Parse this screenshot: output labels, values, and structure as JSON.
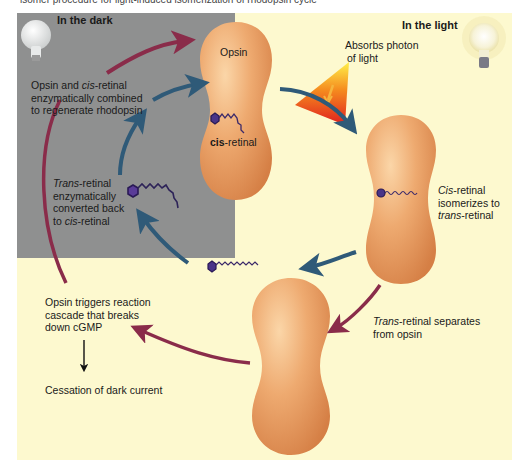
{
  "caption_cut": "isomer procedure for light-induced isomerization of rhodopsin cycle",
  "panels": {
    "dark": {
      "title": "In the dark",
      "icon": "unlit-bulb-icon"
    },
    "light": {
      "title": "In the light",
      "icon": "lit-bulb-icon"
    }
  },
  "labels": {
    "opsin": "Opsin",
    "cis_retinal_bold": "cis",
    "cis_retinal_suffix": "-retinal",
    "absorbs_line1": "Absorbs photon",
    "absorbs_line2": "of light",
    "combine_line1_a": "Opsin and ",
    "combine_line1_it": "cis",
    "combine_line1_b": "-retinal",
    "combine_line2": "enzymatically combined",
    "combine_line3": "to regenerate rhodopsin",
    "convert_line1_it": "Trans",
    "convert_line1_b": "-retinal",
    "convert_line2": "enzymatically",
    "convert_line3": "converted back",
    "convert_line4_a": "to ",
    "convert_line4_it": "cis",
    "convert_line4_b": "-retinal",
    "isom_line1_it": "Cis",
    "isom_line1_b": "-retinal",
    "isom_line2": "isomerizes to",
    "isom_line3_it": "trans",
    "isom_line3_b": "-retinal",
    "sep_line1_it": "Trans",
    "sep_line1_b": "-retinal separates",
    "sep_line2": "from opsin",
    "cascade_line1": "Opsin triggers reaction",
    "cascade_line2": "cascade that breaks",
    "cascade_line3": "down cGMP",
    "cessation": "Cessation of dark current"
  },
  "colors": {
    "dark_panel": "#8f9090",
    "light_panel": "#fdf9cf",
    "opsin": "#e9a066",
    "maroon_arrow": "#8a2c4a",
    "blue_arrow": "#2f5a78",
    "retinal": "#3c2a6a"
  }
}
